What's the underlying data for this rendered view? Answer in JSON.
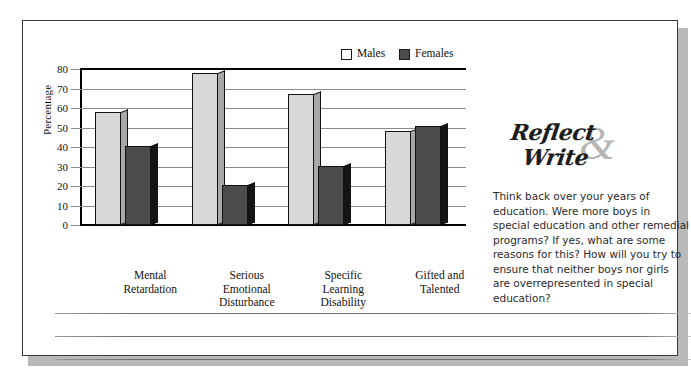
{
  "chart_data": {
    "type": "bar",
    "title": "",
    "xlabel": "",
    "ylabel": "Percentage",
    "ylim": [
      0,
      80
    ],
    "ytick_step": 10,
    "yticks": [
      80,
      70,
      60,
      50,
      40,
      30,
      20,
      10,
      0
    ],
    "grid": true,
    "legend_position": "top-right",
    "categories": [
      "Mental Retardation",
      "Serious Emotional Disturbance",
      "Specific Learning Disability",
      "Gifted and Talented"
    ],
    "category_lines": [
      [
        "Mental",
        "Retardation"
      ],
      [
        "Serious",
        "Emotional",
        "Disturbance"
      ],
      [
        "Specific",
        "Learning",
        "Disability"
      ],
      [
        "Gifted and",
        "Talented"
      ]
    ],
    "series": [
      {
        "name": "Males",
        "color": "#d8d8d8",
        "values": [
          58,
          78,
          67,
          48
        ]
      },
      {
        "name": "Females",
        "color": "#4b4b4b",
        "values": [
          40.5,
          20.5,
          30.5,
          51
        ]
      }
    ]
  },
  "legend": {
    "items": [
      {
        "label": "Males",
        "color": "#d8d8d8"
      },
      {
        "label": "Females",
        "color": "#4b4b4b"
      }
    ]
  },
  "sidebar": {
    "logo": {
      "line1": "Reflect",
      "ampersand": "&",
      "line2": "Write"
    },
    "prompt": "Think back over your years of education. Were more boys in special education and other remedial programs? If yes, what are some reasons for this? How will you try to ensure that neither boys nor girls are overrepresented in special education?"
  },
  "writing_area": {
    "line_count": 3
  }
}
